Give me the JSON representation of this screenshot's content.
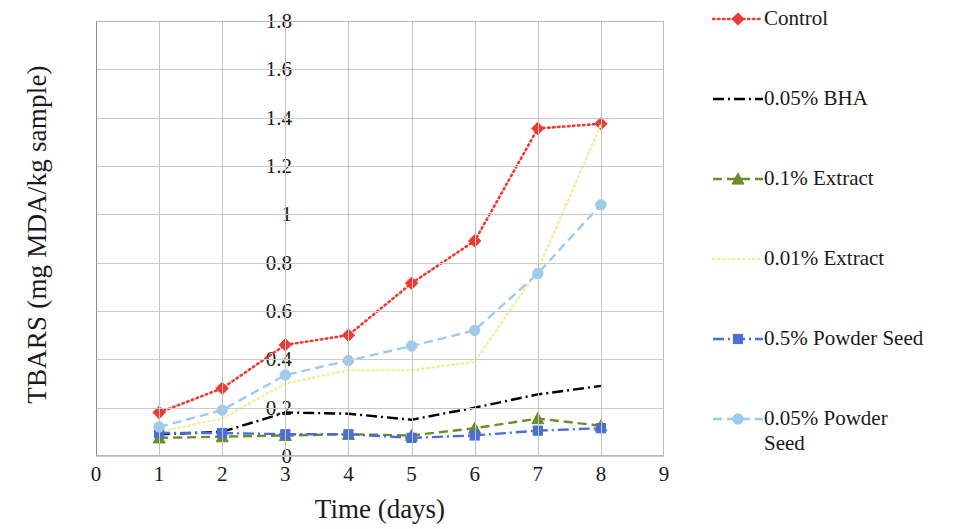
{
  "chart": {
    "type": "line",
    "y_axis_title": "TBARS (mg MDA/kg sample)",
    "x_axis_title": "Time (days)",
    "y_ticks": [
      "0",
      "0.2",
      "0.4",
      "0.6",
      "0.8",
      "1",
      "1.2",
      "1.4",
      "1.6",
      "1.8"
    ],
    "x_ticks": [
      "0",
      "1",
      "2",
      "3",
      "4",
      "5",
      "6",
      "7",
      "8",
      "9"
    ]
  },
  "chart_data": {
    "type": "line",
    "title": "",
    "xlabel": "Time (days)",
    "ylabel": "TBARS (mg MDA/kg sample)",
    "xlim": [
      0,
      9
    ],
    "ylim": [
      0,
      1.8
    ],
    "ytick_step": 0.2,
    "grid": true,
    "legend_position": "right",
    "x": [
      1,
      2,
      3,
      4,
      5,
      6,
      7,
      8
    ],
    "series": [
      {
        "name": "Control",
        "color": "#ED3B33",
        "line_style": "dotted",
        "marker": "diamond",
        "values": [
          0.18,
          0.28,
          0.46,
          0.5,
          0.715,
          0.89,
          1.355,
          1.375
        ]
      },
      {
        "name": "0.05% BHA",
        "color": "#000000",
        "line_style": "dash-dot",
        "marker": "none",
        "values": [
          0.09,
          0.1,
          0.18,
          0.175,
          0.15,
          0.2,
          0.255,
          0.29
        ]
      },
      {
        "name": "0.1% Extract",
        "color": "#6C8B2B",
        "line_style": "dashed",
        "marker": "triangle",
        "values": [
          0.075,
          0.08,
          0.085,
          0.09,
          0.085,
          0.115,
          0.155,
          0.125
        ]
      },
      {
        "name": "0.01% Extract",
        "color": "#F2F0A8",
        "line_style": "dotted",
        "marker": "none",
        "values": [
          0.1,
          0.155,
          0.3,
          0.355,
          0.355,
          0.39,
          0.77,
          1.37
        ]
      },
      {
        "name": "0.5% Powder Seed",
        "color": "#4A6FD4",
        "line_style": "dash-dot",
        "marker": "square",
        "values": [
          0.095,
          0.095,
          0.09,
          0.09,
          0.075,
          0.085,
          0.105,
          0.115
        ]
      },
      {
        "name": "0.05% Powder Seed",
        "color": "#9DCBEF",
        "line_style": "dashed",
        "marker": "circle",
        "values": [
          0.12,
          0.19,
          0.335,
          0.395,
          0.455,
          0.52,
          0.755,
          1.04
        ]
      }
    ]
  },
  "legend": {
    "items": [
      {
        "label": "Control",
        "top": 6
      },
      {
        "label": "0.05% BHA",
        "top": 86
      },
      {
        "label": "0.1% Extract",
        "top": 166
      },
      {
        "label": "0.01% Extract",
        "top": 246
      },
      {
        "label": "0.5% Powder Seed",
        "top": 326
      },
      {
        "label": "0.05% Powder\nSeed",
        "top": 406
      }
    ]
  }
}
